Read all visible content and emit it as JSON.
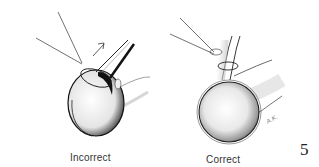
{
  "figure": {
    "number": "5",
    "panels": [
      {
        "id": "incorrect",
        "caption": "Incorrect",
        "arrow": "up-right-arrow"
      },
      {
        "id": "correct",
        "caption": "Correct",
        "signature": "A.K."
      }
    ]
  },
  "colors": {
    "ink": "#1a1a1a",
    "background": "#ffffff",
    "caption": "#333333"
  }
}
